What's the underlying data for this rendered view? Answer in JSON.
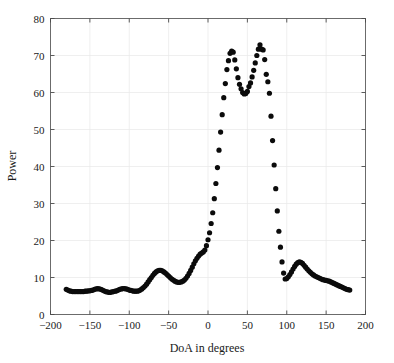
{
  "chart_data": {
    "type": "scatter",
    "title": "",
    "xlabel": "DoA in degrees",
    "ylabel": "Power",
    "xlim": [
      -200,
      200
    ],
    "ylim": [
      0,
      80
    ],
    "xticks": [
      -200,
      -150,
      -100,
      -50,
      0,
      50,
      100,
      150,
      200
    ],
    "xtick_labels": [
      "−200",
      "−150",
      "−100",
      "−50",
      "0",
      "50",
      "100",
      "150",
      "200"
    ],
    "yticks": [
      0,
      10,
      20,
      30,
      40,
      50,
      60,
      70,
      80
    ],
    "ytick_labels": [
      "0",
      "10",
      "20",
      "30",
      "40",
      "50",
      "60",
      "70",
      "80"
    ],
    "grid": true,
    "legend": "none",
    "marker": "dot",
    "marker_color": "#0b0b0b",
    "marker_size": 2.6,
    "series": [
      {
        "name": "MUSIC spatial spectrum",
        "x": [
          -180,
          -178,
          -176,
          -174,
          -172,
          -170,
          -168,
          -166,
          -164,
          -162,
          -160,
          -158,
          -156,
          -154,
          -152,
          -150,
          -148,
          -146,
          -144,
          -142,
          -140,
          -138,
          -136,
          -134,
          -132,
          -130,
          -128,
          -126,
          -124,
          -122,
          -120,
          -118,
          -116,
          -114,
          -112,
          -110,
          -108,
          -106,
          -104,
          -102,
          -100,
          -98,
          -96,
          -94,
          -92,
          -90,
          -88,
          -86,
          -84,
          -82,
          -80,
          -78,
          -76,
          -74,
          -72,
          -70,
          -68,
          -66,
          -64,
          -62,
          -60,
          -58,
          -56,
          -54,
          -52,
          -50,
          -48,
          -46,
          -44,
          -42,
          -40,
          -38,
          -36,
          -34,
          -32,
          -30,
          -28,
          -26,
          -24,
          -22,
          -20,
          -18,
          -16,
          -14,
          -12,
          -10,
          -8,
          -6,
          -4,
          -2,
          0,
          2,
          4,
          6,
          8,
          10,
          12,
          14,
          16,
          18,
          20,
          22,
          24,
          26,
          28,
          30,
          32,
          34,
          36,
          38,
          40,
          42,
          44,
          46,
          48,
          50,
          52,
          54,
          56,
          58,
          60,
          62,
          64,
          66,
          68,
          70,
          72,
          74,
          76,
          78,
          80,
          82,
          84,
          86,
          88,
          90,
          92,
          94,
          96,
          98,
          100,
          102,
          104,
          106,
          108,
          110,
          112,
          114,
          116,
          118,
          120,
          122,
          124,
          126,
          128,
          130,
          132,
          134,
          136,
          138,
          140,
          142,
          144,
          146,
          148,
          150,
          152,
          154,
          156,
          158,
          160,
          162,
          164,
          166,
          168,
          170,
          172,
          174,
          176,
          178,
          180
        ],
        "y": [
          6.8,
          6.6,
          6.4,
          6.3,
          6.2,
          6.2,
          6.2,
          6.2,
          6.2,
          6.2,
          6.2,
          6.2,
          6.3,
          6.3,
          6.4,
          6.4,
          6.5,
          6.6,
          6.8,
          6.9,
          7.0,
          6.9,
          6.8,
          6.6,
          6.4,
          6.2,
          6.1,
          6.0,
          6.0,
          6.1,
          6.2,
          6.3,
          6.4,
          6.6,
          6.8,
          6.9,
          7.0,
          7.0,
          6.9,
          6.8,
          6.6,
          6.5,
          6.4,
          6.3,
          6.3,
          6.3,
          6.4,
          6.6,
          6.9,
          7.3,
          7.7,
          8.2,
          8.8,
          9.4,
          10.0,
          10.6,
          11.1,
          11.5,
          11.8,
          11.9,
          11.9,
          11.8,
          11.5,
          11.2,
          10.8,
          10.4,
          10.0,
          9.6,
          9.3,
          9.0,
          8.8,
          8.7,
          8.7,
          8.8,
          9.0,
          9.3,
          9.8,
          10.4,
          11.1,
          11.9,
          12.8,
          13.7,
          14.5,
          15.2,
          15.8,
          16.3,
          16.6,
          16.9,
          17.4,
          18.6,
          20.2,
          22.1,
          24.6,
          27.5,
          31.3,
          35.4,
          39.7,
          44.4,
          49.3,
          54.0,
          58.6,
          62.4,
          66.2,
          68.6,
          70.6,
          71.2,
          70.9,
          68.8,
          66.4,
          64.0,
          62.2,
          61.0,
          60.0,
          59.6,
          59.7,
          60.3,
          61.6,
          62.6,
          64.2,
          66.0,
          68.0,
          70.0,
          71.7,
          72.9,
          71.7,
          71.5,
          68.9,
          64.9,
          62.9,
          59.8,
          53.6,
          47.0,
          40.4,
          34.0,
          28.0,
          22.5,
          18.2,
          14.2,
          11.2,
          9.6,
          9.7,
          10.2,
          10.8,
          11.5,
          12.3,
          13.0,
          13.6,
          14.0,
          14.2,
          14.1,
          13.8,
          13.3,
          12.8,
          12.3,
          11.8,
          11.4,
          11.0,
          10.7,
          10.4,
          10.2,
          10.0,
          9.8,
          9.6,
          9.4,
          9.3,
          9.2,
          9.1,
          9.0,
          8.8,
          8.6,
          8.4,
          8.2,
          8.0,
          7.8,
          7.6,
          7.4,
          7.2,
          7.0,
          6.8,
          6.7,
          6.6
        ]
      }
    ]
  }
}
